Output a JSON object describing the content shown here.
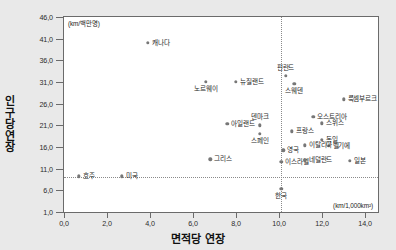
{
  "chart_data": {
    "type": "scatter",
    "title": "",
    "xlabel": "면적당 연장",
    "ylabel": "인구당 연장",
    "x_unit": "(km/1,000km²)",
    "y_unit": "(km/백만명)",
    "xlim": [
      0.0,
      14.6
    ],
    "ylim": [
      1.0,
      46.0
    ],
    "xticks": [
      "0,0",
      "2,0",
      "4,0",
      "6,0",
      "8,0",
      "10,0",
      "12,0",
      "14,0"
    ],
    "xtick_values": [
      0,
      2,
      4,
      6,
      8,
      10,
      12,
      14
    ],
    "yticks": [
      "46,0",
      "41,0",
      "36,0",
      "31,0",
      "26,0",
      "21,0",
      "16,0",
      "11,0",
      "6,0",
      "1,0"
    ],
    "ytick_values": [
      46,
      41,
      36,
      31,
      26,
      21,
      16,
      11,
      6,
      1
    ],
    "grid": false,
    "legend": "none",
    "reference_lines": {
      "vertical_x": 10.1,
      "horizontal_y": 9.0,
      "style": "dotted",
      "note": "한국 기준선"
    },
    "points": [
      {
        "label": "캐나다",
        "x": 3.9,
        "y": 40.0,
        "label_pos": "r"
      },
      {
        "label": "노르웨이",
        "x": 6.6,
        "y": 31.0,
        "label_pos": "b"
      },
      {
        "label": "뉴질랜드",
        "x": 8.0,
        "y": 31.0,
        "label_pos": "r"
      },
      {
        "label": "핀란드",
        "x": 10.3,
        "y": 32.4,
        "label_pos": "t"
      },
      {
        "label": "스웨덴",
        "x": 10.7,
        "y": 30.6,
        "label_pos": "b"
      },
      {
        "label": "룩셈부르크",
        "x": 13.0,
        "y": 27.0,
        "label_pos": "r"
      },
      {
        "label": "오스트리아",
        "x": 11.6,
        "y": 23.0,
        "label_pos": "r"
      },
      {
        "label": "스위스",
        "x": 12.0,
        "y": 21.5,
        "label_pos": "r"
      },
      {
        "label": "아일랜드",
        "x": 7.6,
        "y": 21.4,
        "label_pos": "r"
      },
      {
        "label": "덴마크",
        "x": 9.1,
        "y": 21.0,
        "label_pos": "t"
      },
      {
        "label": "스페인",
        "x": 9.1,
        "y": 19.1,
        "label_pos": "b"
      },
      {
        "label": "프랑스",
        "x": 10.6,
        "y": 19.6,
        "label_pos": "r"
      },
      {
        "label": "독일",
        "x": 12.0,
        "y": 17.6,
        "label_pos": "r"
      },
      {
        "label": "벨기에",
        "x": 12.3,
        "y": 16.3,
        "label_pos": "r"
      },
      {
        "label": "이탈리아",
        "x": 11.2,
        "y": 16.4,
        "label_pos": "r"
      },
      {
        "label": "영국",
        "x": 10.2,
        "y": 15.2,
        "label_pos": "r"
      },
      {
        "label": "그리스",
        "x": 6.8,
        "y": 13.2,
        "label_pos": "r"
      },
      {
        "label": "이스라엘",
        "x": 10.1,
        "y": 12.6,
        "label_pos": "r"
      },
      {
        "label": "네덜란드",
        "x": 11.2,
        "y": 12.9,
        "label_pos": "r"
      },
      {
        "label": "일본",
        "x": 13.3,
        "y": 12.8,
        "label_pos": "r"
      },
      {
        "label": "호주",
        "x": 0.7,
        "y": 9.2,
        "label_pos": "r"
      },
      {
        "label": "미국",
        "x": 2.7,
        "y": 9.2,
        "label_pos": "r"
      },
      {
        "label": "한국",
        "x": 10.1,
        "y": 6.3,
        "label_pos": "b"
      }
    ]
  }
}
